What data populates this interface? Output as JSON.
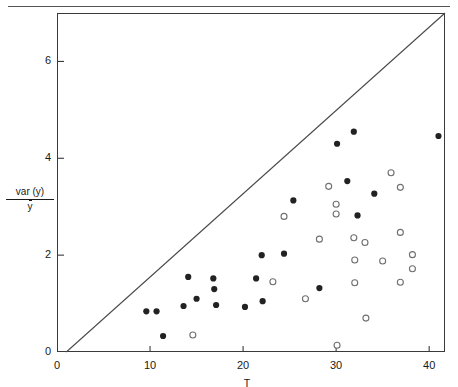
{
  "figure": {
    "background_color": "#ffffff",
    "ink_color": "#1a1a1a",
    "frame_color": "#3a3a3a"
  },
  "axes": {
    "x_title": "T",
    "y_title_numerator": "var (y)",
    "y_title_denominator": "y",
    "x_ticks": [
      "0",
      "10",
      "20",
      "30",
      "40"
    ],
    "y_ticks": [
      "0",
      "2",
      "4",
      "6"
    ],
    "x_origin_label": "0",
    "y_origin_label": "0"
  },
  "chart_data": {
    "type": "scatter",
    "title": "",
    "subtitle": "",
    "xlabel": "T",
    "ylabel": "var (y) / ȳ",
    "xlim": [
      0,
      41.7
    ],
    "ylim": [
      0,
      7.0
    ],
    "x_ticks": [
      0,
      10,
      20,
      30,
      40
    ],
    "y_ticks": [
      0,
      2,
      4,
      6
    ],
    "grid": false,
    "legend": null,
    "legend_position": "none",
    "annotations": [
      {
        "type": "line",
        "name": "diagonal-reference-line",
        "description": "straight line from lower-left origin to upper-right corner of frame",
        "x_start": 1.0,
        "y_start": 0.0,
        "x_end": 41.7,
        "y_end": 7.0
      }
    ],
    "series": [
      {
        "name": "filled",
        "marker": "filled-circle",
        "color": "#222222",
        "points": [
          {
            "x": 9.6,
            "y": 0.84
          },
          {
            "x": 10.7,
            "y": 0.84
          },
          {
            "x": 11.4,
            "y": 0.33
          },
          {
            "x": 13.6,
            "y": 0.95
          },
          {
            "x": 14.1,
            "y": 1.55
          },
          {
            "x": 15.0,
            "y": 1.1
          },
          {
            "x": 16.8,
            "y": 1.52
          },
          {
            "x": 16.9,
            "y": 1.3
          },
          {
            "x": 17.1,
            "y": 0.97
          },
          {
            "x": 20.2,
            "y": 0.93
          },
          {
            "x": 21.4,
            "y": 1.52
          },
          {
            "x": 22.0,
            "y": 2.0
          },
          {
            "x": 22.1,
            "y": 1.05
          },
          {
            "x": 24.4,
            "y": 2.03
          },
          {
            "x": 25.4,
            "y": 3.13
          },
          {
            "x": 28.2,
            "y": 1.32
          },
          {
            "x": 30.1,
            "y": 4.3
          },
          {
            "x": 31.2,
            "y": 3.53
          },
          {
            "x": 31.9,
            "y": 4.55
          },
          {
            "x": 32.3,
            "y": 2.82
          },
          {
            "x": 34.1,
            "y": 3.27
          },
          {
            "x": 41.0,
            "y": 4.46
          }
        ]
      },
      {
        "name": "open",
        "marker": "open-circle",
        "color": "#6f6f6f",
        "points": [
          {
            "x": 14.6,
            "y": 0.35
          },
          {
            "x": 23.2,
            "y": 1.45
          },
          {
            "x": 24.4,
            "y": 2.8
          },
          {
            "x": 26.7,
            "y": 1.1
          },
          {
            "x": 28.2,
            "y": 2.33
          },
          {
            "x": 29.2,
            "y": 3.42
          },
          {
            "x": 30.0,
            "y": 3.05
          },
          {
            "x": 30.0,
            "y": 2.85
          },
          {
            "x": 30.1,
            "y": 0.14
          },
          {
            "x": 31.9,
            "y": 2.36
          },
          {
            "x": 33.1,
            "y": 2.26
          },
          {
            "x": 32.0,
            "y": 1.9
          },
          {
            "x": 32.0,
            "y": 1.43
          },
          {
            "x": 33.2,
            "y": 0.7
          },
          {
            "x": 35.0,
            "y": 1.88
          },
          {
            "x": 35.9,
            "y": 3.7
          },
          {
            "x": 36.9,
            "y": 3.4
          },
          {
            "x": 36.9,
            "y": 2.47
          },
          {
            "x": 36.9,
            "y": 1.44
          },
          {
            "x": 38.2,
            "y": 2.01
          },
          {
            "x": 38.2,
            "y": 1.72
          }
        ]
      }
    ]
  }
}
